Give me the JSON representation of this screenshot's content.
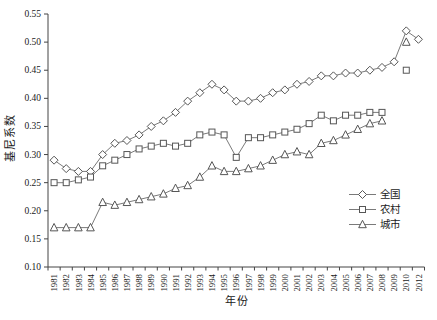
{
  "page": {
    "background": "#ffffff"
  },
  "chart_data": {
    "type": "line",
    "title": "",
    "xlabel": "年份",
    "ylabel": "基尼系数",
    "ylim": [
      0.1,
      0.55
    ],
    "ytick_labels": [
      "0.10",
      "0.15",
      "0.20",
      "0.25",
      "0.30",
      "0.35",
      "0.40",
      "0.45",
      "0.50",
      "0.55"
    ],
    "grid": false,
    "legend_position": "inside-right-middle",
    "axis_color": "#444444",
    "tick_text_color": "#1a1a1a",
    "line_color": "#6b6b6b",
    "marker_color": "#565656",
    "categories": [
      "1981",
      "1982",
      "1983",
      "1984",
      "1985",
      "1986",
      "1987",
      "1988",
      "1989",
      "1990",
      "1991",
      "1992",
      "1993",
      "1994",
      "1995",
      "1996",
      "1997",
      "1998",
      "1999",
      "2000",
      "2001",
      "2002",
      "2003",
      "2004",
      "2005",
      "2006",
      "2007",
      "2008",
      "2009",
      "2010",
      "2012"
    ],
    "series": [
      {
        "name": "全国",
        "marker": "diamond",
        "values": [
          0.29,
          0.275,
          0.27,
          0.27,
          0.3,
          0.32,
          0.325,
          0.335,
          0.35,
          0.36,
          0.375,
          0.395,
          0.41,
          0.425,
          0.415,
          0.395,
          0.395,
          0.4,
          0.41,
          0.415,
          0.425,
          0.43,
          0.44,
          0.44,
          0.445,
          0.445,
          0.45,
          0.455,
          0.465,
          0.52,
          0.505
        ]
      },
      {
        "name": "农村",
        "marker": "square",
        "values": [
          0.25,
          0.25,
          0.255,
          0.26,
          0.28,
          0.29,
          0.3,
          0.31,
          0.315,
          0.32,
          0.315,
          0.32,
          0.335,
          0.34,
          0.335,
          0.295,
          0.33,
          0.33,
          0.335,
          0.34,
          0.345,
          0.355,
          0.37,
          0.36,
          0.37,
          0.37,
          0.375,
          0.375,
          null,
          0.45,
          null
        ]
      },
      {
        "name": "城市",
        "marker": "triangle",
        "values": [
          0.17,
          0.17,
          0.17,
          0.17,
          0.215,
          0.21,
          0.215,
          0.22,
          0.225,
          0.23,
          0.24,
          0.245,
          0.26,
          0.28,
          0.27,
          0.27,
          0.275,
          0.28,
          0.29,
          0.3,
          0.305,
          0.3,
          0.32,
          0.325,
          0.335,
          0.345,
          0.355,
          0.36,
          null,
          0.5,
          null
        ]
      }
    ]
  }
}
